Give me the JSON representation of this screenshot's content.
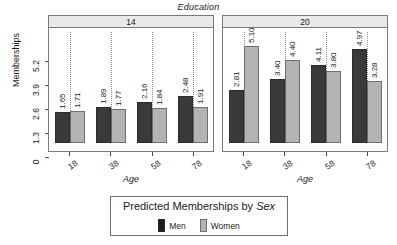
{
  "title": "Education",
  "axes": {
    "ylabel": "Memberships",
    "xlabel_left": "Age",
    "xlabel_right": "Age",
    "yticks": [
      "0",
      "1.3",
      "2.6",
      "3.9",
      "5.2"
    ],
    "xticks": [
      "18",
      "38",
      "58",
      "78"
    ]
  },
  "panels": [
    {
      "strip": "14"
    },
    {
      "strip": "20"
    }
  ],
  "legend": {
    "title_main": "Predicted Memberships by ",
    "title_italic": "Sex",
    "items": [
      {
        "label": "Men",
        "color": "#1c1c1c"
      },
      {
        "label": "Women",
        "color": "#b3b3b3"
      }
    ]
  },
  "chart_data": {
    "type": "bar",
    "title": "Education",
    "xlabel": "Age",
    "ylabel": "Memberships",
    "ylim": [
      0,
      5.85
    ],
    "yticks": [
      0,
      1.3,
      2.6,
      3.9,
      5.2
    ],
    "categories": [
      "18",
      "38",
      "58",
      "78"
    ],
    "grid": "vertical-dotted",
    "legend_position": "bottom",
    "legend_title": "Predicted Memberships by Sex",
    "panel_variable": "Education",
    "panels": [
      {
        "panel_label": "14",
        "series": [
          {
            "name": "Men",
            "color": "#3a3a3a",
            "values": [
              1.65,
              1.89,
              2.16,
              2.48
            ]
          },
          {
            "name": "Women",
            "color": "#b3b3b3",
            "values": [
              1.71,
              1.77,
              1.84,
              1.91
            ]
          }
        ]
      },
      {
        "panel_label": "20",
        "series": [
          {
            "name": "Men",
            "color": "#3a3a3a",
            "values": [
              2.81,
              3.4,
              4.11,
              4.97
            ]
          },
          {
            "name": "Women",
            "color": "#b3b3b3",
            "values": [
              5.1,
              4.4,
              3.8,
              3.28
            ]
          }
        ]
      }
    ],
    "bar_labels": {
      "14": {
        "Men": [
          "1.65",
          "1.89",
          "2.16",
          "2.48"
        ],
        "Women": [
          "1.71",
          "1.77",
          "1.84",
          "1.91"
        ]
      },
      "20": {
        "Men": [
          "2.81",
          "3.40",
          "4.11",
          "4.97"
        ],
        "Women": [
          "5.10",
          "4.40",
          "3.80",
          "3.28"
        ]
      }
    }
  }
}
